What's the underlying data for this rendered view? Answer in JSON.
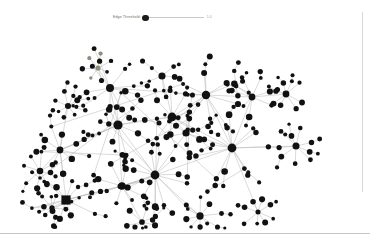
{
  "app": {
    "title": "Network Graph Viewer",
    "background": "#ffffff"
  },
  "controls": {
    "edge_threshold": {
      "label": "Edge Threshold:",
      "value": "0",
      "min_label": "0",
      "max_label": "1.0",
      "thumb_position_pct": 3
    }
  },
  "graph": {
    "node_color": "#111111",
    "node_alt_color": "#8f8f7a",
    "edge_color": "#b4b4b4",
    "selected_node_shape": "square",
    "node_count": "236",
    "edge_count": "312",
    "layout": "force-directed"
  },
  "chart_data": {
    "type": "scatter",
    "title": "",
    "xlabel": "",
    "ylabel": "",
    "nodes": [
      {
        "id": 0,
        "x": 118,
        "y": 125,
        "r": 4.6,
        "c": "#111111"
      },
      {
        "id": 1,
        "x": 172,
        "y": 117,
        "r": 4.4,
        "c": "#111111"
      },
      {
        "id": 2,
        "x": 206,
        "y": 95,
        "r": 4.2,
        "c": "#111111"
      },
      {
        "id": 3,
        "x": 232,
        "y": 148,
        "r": 4.4,
        "c": "#111111"
      },
      {
        "id": 4,
        "x": 155,
        "y": 175,
        "r": 4.4,
        "c": "#111111"
      },
      {
        "id": 5,
        "x": 110,
        "y": 88,
        "r": 4.0,
        "c": "#111111"
      },
      {
        "id": 6,
        "x": 66,
        "y": 200,
        "r": 4.6,
        "c": "#111111",
        "shape": "square"
      },
      {
        "id": 7,
        "x": 186,
        "y": 133,
        "r": 3.6,
        "c": "#111111"
      },
      {
        "id": 8,
        "x": 122,
        "y": 186,
        "r": 3.8,
        "c": "#111111"
      },
      {
        "id": 9,
        "x": 60,
        "y": 150,
        "r": 3.4,
        "c": "#111111"
      },
      {
        "id": 10,
        "x": 252,
        "y": 97,
        "r": 3.4,
        "c": "#111111"
      }
    ],
    "edges_visible": true,
    "legend": []
  }
}
